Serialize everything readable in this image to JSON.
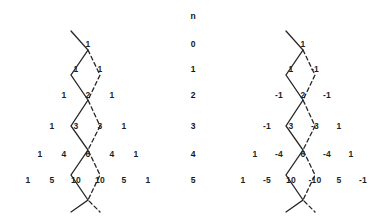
{
  "figure": {
    "background_color": "#ffffff",
    "text_color": "#1f1f1f",
    "line_color": "#262626"
  },
  "column_header": {
    "label": "n",
    "x": 193,
    "y": 16
  },
  "row_index": {
    "label": "n",
    "values": [
      "0",
      "1",
      "2",
      "3",
      "4",
      "5"
    ],
    "x": 193,
    "ys": [
      44,
      69,
      95,
      126,
      154,
      180
    ]
  },
  "left_triangle": {
    "name": "pascal-triangle",
    "apex_x": 88,
    "row_ys": [
      44,
      69,
      95,
      126,
      154,
      180
    ],
    "col_step": 24,
    "rows": [
      {
        "n": "0",
        "values": [
          "1"
        ]
      },
      {
        "n": "1",
        "values": [
          "1",
          "1"
        ]
      },
      {
        "n": "2",
        "values": [
          "1",
          "2",
          "1"
        ]
      },
      {
        "n": "3",
        "values": [
          "1",
          "3",
          "3",
          "1"
        ]
      },
      {
        "n": "4",
        "values": [
          "1",
          "4",
          "6",
          "4",
          "1"
        ]
      },
      {
        "n": "5",
        "values": [
          "1",
          "5",
          "10",
          "10",
          "5",
          "1"
        ]
      }
    ]
  },
  "right_triangle": {
    "name": "signed-pascal-triangle",
    "apex_x": 303,
    "row_ys": [
      44,
      69,
      95,
      126,
      154,
      180
    ],
    "col_step": 24,
    "rows": [
      {
        "n": "0",
        "values": [
          "1"
        ]
      },
      {
        "n": "1",
        "values": [
          "1",
          "-1"
        ]
      },
      {
        "n": "2",
        "values": [
          "-1",
          "2",
          "-1"
        ]
      },
      {
        "n": "3",
        "values": [
          "-1",
          "3",
          "-3",
          "1"
        ]
      },
      {
        "n": "4",
        "values": [
          "1",
          "-4",
          "6",
          "-4",
          "1"
        ]
      },
      {
        "n": "5",
        "values": [
          "1",
          "-5",
          "10",
          "-10",
          "5",
          "-1"
        ]
      }
    ]
  },
  "paths": {
    "solid": {
      "name": "solid-zigzag-path",
      "style": "solid",
      "stroke_width": 1.3
    },
    "dashed": {
      "name": "dashed-zigzag-path",
      "style": "dashed",
      "dash_pattern": "4 3",
      "stroke_width": 1.3
    }
  }
}
